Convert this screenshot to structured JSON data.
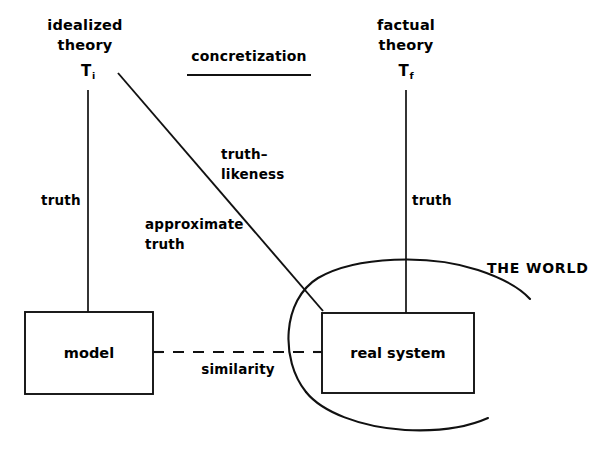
{
  "figure": {
    "line_color": "#111111",
    "background_color": "#ffffff"
  },
  "nodes": {
    "idealized_theory": {
      "line1": "idealized",
      "line2": "theory",
      "symbol": "T",
      "symbol_sub": "i"
    },
    "factual_theory": {
      "line1": "factual",
      "line2": "theory",
      "symbol": "T",
      "symbol_sub": "f"
    },
    "model_box": {
      "label": "model"
    },
    "real_system_box": {
      "label": "real  system"
    },
    "world": {
      "label": "THE WORLD"
    }
  },
  "edges": {
    "concretization": {
      "label": "concretization"
    },
    "truth_left": {
      "label": "truth"
    },
    "truth_right": {
      "label": "truth"
    },
    "truthlikeness": {
      "line1": "truth–",
      "line2": "likeness"
    },
    "approximate_truth": {
      "line1": "approximate",
      "line2": "truth"
    },
    "similarity": {
      "label": "similarity"
    }
  }
}
